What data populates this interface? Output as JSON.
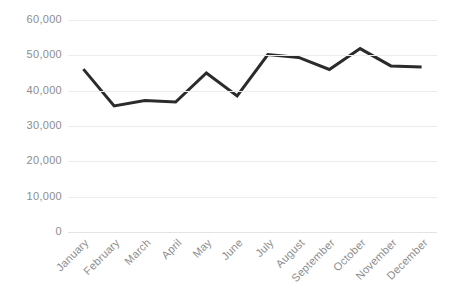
{
  "chart_data": {
    "type": "line",
    "title": "",
    "subtitle": "",
    "xlabel": "",
    "ylabel": "",
    "categories": [
      "January",
      "February",
      "March",
      "April",
      "May",
      "June",
      "July",
      "August",
      "September",
      "October",
      "November",
      "December"
    ],
    "values": [
      46100,
      35700,
      37200,
      36800,
      45000,
      38500,
      50200,
      49400,
      46000,
      51900,
      47000,
      46700
    ],
    "series": [
      {
        "name": "",
        "values": [
          46100,
          35700,
          37200,
          36800,
          45000,
          38500,
          50200,
          49400,
          46000,
          51900,
          47000,
          46700
        ]
      }
    ],
    "ylim": [
      0,
      60000
    ],
    "y_ticks": [
      0,
      10000,
      20000,
      30000,
      40000,
      50000,
      60000
    ],
    "y_tick_labels": [
      "0",
      "10,000",
      "20,000",
      "30,000",
      "40,000",
      "50,000",
      "60,000"
    ],
    "grid": true,
    "grid_axis": "y",
    "legend": false,
    "legend_position": "none",
    "markers": false,
    "line_color": "#2b2b2b",
    "grid_color": "#ececec",
    "tick_label_color": "#8d8d8d",
    "background_color": "#ffffff",
    "xtick_rotation": -45
  }
}
